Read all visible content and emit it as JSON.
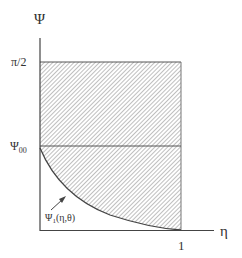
{
  "diagram": {
    "y_axis_label": "Ψ",
    "x_axis_label": "η",
    "y_tick_top": "π/2",
    "y_tick_mid": "Ψ",
    "y_tick_mid_sub": "00",
    "x_tick_right": "1",
    "curve_label_main": "Ψ",
    "curve_label_sub": "1",
    "curve_label_args": "(η,θ)",
    "colors": {
      "line": "#444444",
      "hatch": "#8a8a8a"
    }
  }
}
